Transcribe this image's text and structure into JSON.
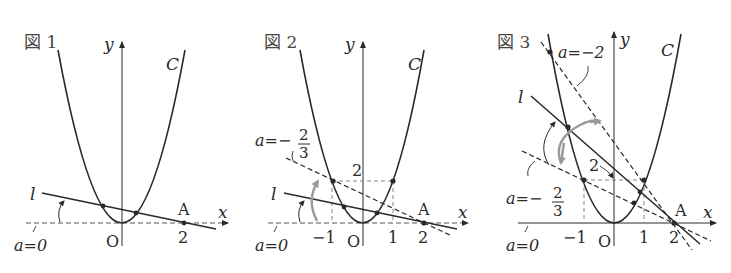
{
  "figures": [
    {
      "title": "図 1",
      "curve_label": "C",
      "line_label": "l",
      "axis_x": "x",
      "axis_y": "y",
      "origin": "O",
      "point_A": "A",
      "tick_labels": [
        "2"
      ],
      "annotations": [
        "a=0"
      ]
    },
    {
      "title": "図 2",
      "curve_label": "C",
      "line_label": "l",
      "axis_x": "x",
      "axis_y": "y",
      "origin": "O",
      "point_A": "A",
      "tick_labels": [
        "-1",
        "1",
        "2"
      ],
      "y_tick": "2",
      "annotations": [
        "a=0",
        "a=-",
        "2",
        "3"
      ]
    },
    {
      "title": "図 3",
      "curve_label": "C",
      "line_label": "l",
      "axis_x": "x",
      "axis_y": "y",
      "origin": "O",
      "point_A": "A",
      "tick_labels": [
        "-1",
        "1",
        "2"
      ],
      "y_tick": "2",
      "annotations": [
        "a=0",
        "a=-",
        "2",
        "3",
        "a=-2"
      ]
    }
  ],
  "text": {
    "f1_title": "図 1",
    "f2_title": "図 2",
    "f3_title": "図 3",
    "C": "C",
    "l": "l",
    "x": "x",
    "y": "y",
    "O": "O",
    "A": "A",
    "two": "2",
    "one": "1",
    "neg_one": "−1",
    "a_eq_0": "a=0",
    "a_eq_minus": "a=−",
    "a_eq_minus_2": "a=−2",
    "frac_num": "2",
    "frac_den": "3"
  },
  "colors": {
    "ink": "#2a2a2a",
    "gray_arrow": "#9a9a9a",
    "dashed": "#555555"
  }
}
